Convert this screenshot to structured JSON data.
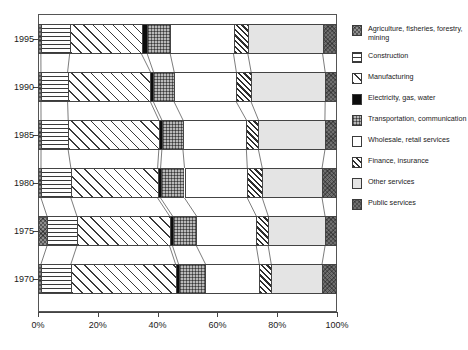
{
  "chart_data": {
    "type": "bar",
    "orientation": "horizontal",
    "stacked": true,
    "normalized_percent": true,
    "title": "",
    "xlabel": "",
    "ylabel": "",
    "xlim": [
      0,
      100
    ],
    "xticks": [
      0,
      20,
      40,
      60,
      80,
      100
    ],
    "xtick_labels": [
      "0%",
      "20%",
      "40%",
      "60%",
      "80%",
      "100%"
    ],
    "categories": [
      "1995",
      "1990",
      "1985",
      "1980",
      "1975",
      "1970"
    ],
    "grid": false,
    "legend_position": "right",
    "connector_lines": true,
    "series": [
      {
        "name": "Agriculture, fisheries, forestry, mining",
        "pattern": "dark-crosshatch",
        "values": [
          1,
          1,
          1,
          1,
          3,
          1
        ]
      },
      {
        "name": "Construction",
        "pattern": "horizontal-lines",
        "values": [
          10,
          9,
          9,
          10,
          10,
          10
        ]
      },
      {
        "name": "Manufacturing",
        "pattern": "diagonal-lines",
        "values": [
          25,
          28,
          30,
          29,
          31,
          35
        ]
      },
      {
        "name": "Electricity, gas, water",
        "pattern": "solid-black",
        "values": [
          2,
          1,
          1,
          1,
          1,
          1
        ]
      },
      {
        "name": "Transportation, communication",
        "pattern": "checker",
        "values": [
          8,
          7,
          7,
          8,
          8,
          9
        ]
      },
      {
        "name": "Wholesale, retail services",
        "pattern": "white",
        "values": [
          22,
          21,
          21,
          21,
          20,
          18
        ]
      },
      {
        "name": "Finance, insurance",
        "pattern": "dense-hatch",
        "values": [
          5,
          5,
          4,
          5,
          4,
          4
        ]
      },
      {
        "name": "Other services",
        "pattern": "dotted",
        "values": [
          26,
          25,
          22,
          20,
          19,
          17
        ]
      },
      {
        "name": "Public services",
        "pattern": "dark-gray",
        "values": [
          5,
          4,
          4,
          5,
          4,
          5
        ]
      }
    ]
  },
  "legend": {
    "items": [
      {
        "label": "Agriculture, fisheries, forestry, mining",
        "swatch": "dark-crosshatch-swatch"
      },
      {
        "label": "Construction",
        "swatch": "horizontal-lines-swatch"
      },
      {
        "label": "Manufacturing",
        "swatch": "diagonal-lines-swatch"
      },
      {
        "label": "Electricity, gas, water",
        "swatch": "solid-black-swatch"
      },
      {
        "label": "Transportation, communication",
        "swatch": "checker-swatch"
      },
      {
        "label": "Wholesale, retail services",
        "swatch": "white-swatch"
      },
      {
        "label": "Finance, insurance",
        "swatch": "dense-hatch-swatch"
      },
      {
        "label": "Other services",
        "swatch": "dotted-swatch"
      },
      {
        "label": "Public services",
        "swatch": "dark-gray-swatch"
      }
    ]
  },
  "caption": {
    "text": ""
  },
  "colors": {
    "axis": "#444444",
    "text": "#1a1a1a",
    "background": "#ffffff",
    "agriculture": "#8d8d8d",
    "electricity": "#0d0d0d",
    "transportation": "#b9b9b9",
    "other_services": "#e4e4e4",
    "public_services": "#6f6f6f"
  }
}
